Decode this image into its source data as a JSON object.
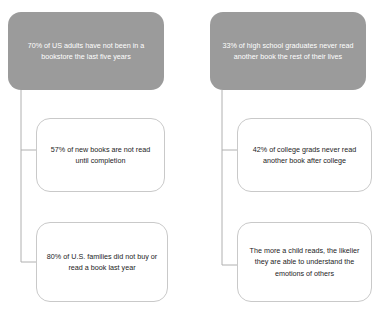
{
  "diagram": {
    "type": "tree",
    "background_color": "#ffffff",
    "header_fill_color": "#9b9b9b",
    "header_text_color": "#ffffff",
    "leaf_border_color": "#c9c9c9",
    "connector_color": "#b0b0b0",
    "branches": [
      {
        "id": "left",
        "root": {
          "text": "70% of US adults have not been in a bookstore the last five years"
        },
        "children": [
          {
            "text": "57% of new books are not read until completion"
          },
          {
            "text": "80% of U.S. families did not buy or read a book last year"
          }
        ]
      },
      {
        "id": "right",
        "root": {
          "text": "33% of high school graduates never read another book the rest of their lives"
        },
        "children": [
          {
            "text": "42% of college grads never read another book after college"
          },
          {
            "text": "The more a child reads, the likelier they are able to understand the emotions of others"
          }
        ]
      }
    ]
  }
}
